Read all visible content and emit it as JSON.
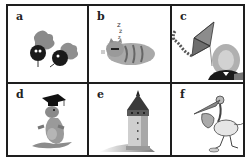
{
  "panels": [
    {
      "label": "a",
      "image": "berries-with-leaves-icon"
    },
    {
      "label": "b",
      "image": "sleeping-cat-icon"
    },
    {
      "label": "c",
      "image": "kite-and-portrait-icon"
    },
    {
      "label": "d",
      "image": "kangaroo-graduate-icon"
    },
    {
      "label": "e",
      "image": "tower-icon"
    },
    {
      "label": "f",
      "image": "stork-icon"
    }
  ],
  "colors": {
    "border": "#1e1e1e",
    "background": "#ffffff",
    "ink": "#222222"
  }
}
